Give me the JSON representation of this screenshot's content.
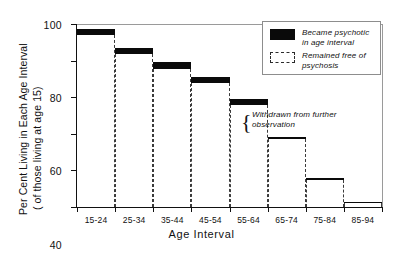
{
  "chart_data": {
    "type": "bar",
    "title": "",
    "xlabel": "Age  Interval",
    "ylabel_line1": "Per Cent Living in Each Age Interval",
    "ylabel_line2": "( of those living at age 15)",
    "categories": [
      "15-24",
      "25-34",
      "35-44",
      "45-54",
      "55-64",
      "65-74",
      "75-84",
      "85-94"
    ],
    "ylim": [
      0,
      100
    ],
    "yticks": [
      0,
      20,
      40,
      60,
      80,
      100
    ],
    "ytick_labels": [
      "0",
      "20",
      "40",
      "60",
      "80",
      "100"
    ],
    "grid": false,
    "legend_position": "top-right",
    "stacked": true,
    "series": [
      {
        "name": "Remained free of psychosis",
        "fill": "none-dashed-outline",
        "values": [
          94.0,
          83.5,
          75.5,
          68.0,
          56.0,
          37.0,
          14.5,
          2.0
        ]
      },
      {
        "name": "Became psychotic in age interval",
        "fill": "solid-black",
        "values": [
          3.5,
          3.5,
          3.5,
          3.0,
          3.0,
          1.5,
          1.5,
          1.0
        ]
      }
    ],
    "bar_tops": [
      97.5,
      87.0,
      79.0,
      71.0,
      59.0,
      38.5,
      16.0,
      3.0
    ],
    "annotations": [
      {
        "text_line1": "Withdrawn from further",
        "text_line2": "observation",
        "marker": "brace",
        "points_between": [
          "55-64",
          "65-74"
        ]
      }
    ]
  },
  "legend": {
    "items": [
      {
        "swatch": "solid",
        "line1": "Became psychotic",
        "line2": "in age interval"
      },
      {
        "swatch": "dashed",
        "line1": "Remained free of",
        "line2": "psychosis"
      }
    ]
  },
  "colors": {
    "psychotic_band": "#0a0a0a",
    "survivor_outline": "#3b3b3b",
    "axis": "#111111",
    "background": "#ffffff"
  }
}
